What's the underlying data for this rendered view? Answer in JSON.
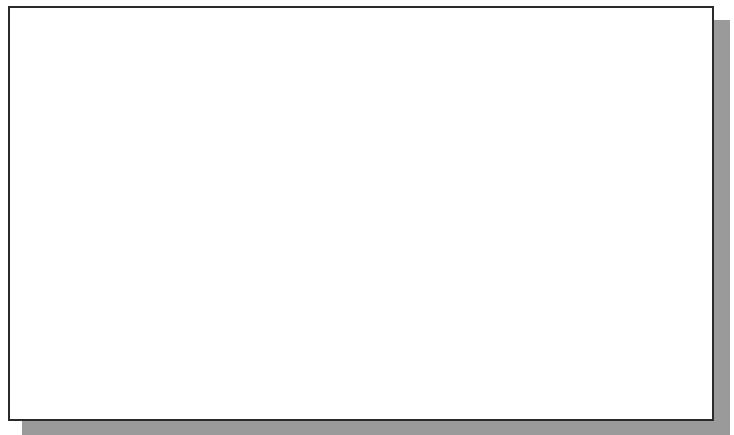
{
  "canvas": {
    "background": "#ffffff",
    "border_color": "#2a2a2a",
    "shadow_color": "#9a9a9a",
    "grid": {
      "color": "#b8b8b8",
      "spacing_px": 60.5,
      "vertical_x": [
        36,
        96,
        157,
        215,
        275,
        335,
        395,
        455,
        576,
        637,
        697
      ],
      "horizontal_y": [
        48,
        109,
        170,
        231,
        291,
        352,
        411
      ]
    }
  },
  "entities": {
    "circle": {
      "type": "circle",
      "center": [
        195,
        224
      ],
      "radius": 168,
      "stroke": "#1a1a1a"
    },
    "center_point": {
      "type": "point",
      "position": [
        195,
        222
      ],
      "color": "#111111"
    },
    "vertical_line": {
      "type": "line",
      "x": 516,
      "y1": 6,
      "y2": 421,
      "stroke": "#2a2a2a"
    }
  },
  "cursor": {
    "type": "crosshair",
    "position": [
      659,
      90
    ],
    "icon": "crosshair-cursor-icon"
  }
}
